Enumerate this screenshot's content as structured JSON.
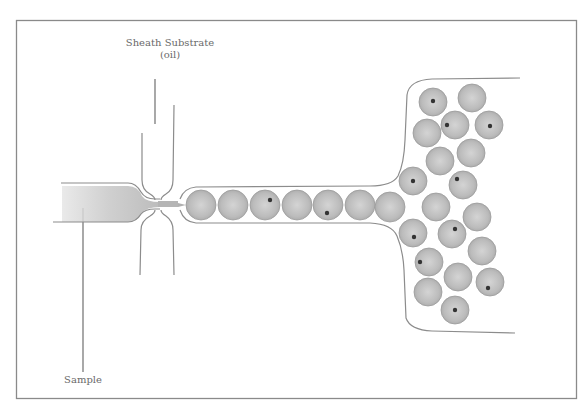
{
  "figure": {
    "labels": {
      "sheath_line1": "Sheath Substrate",
      "sheath_line2": "(oil)",
      "sample": "Sample"
    }
  },
  "colors": {
    "frame": "#8a8a8a",
    "channel_wall": "#8c8c8c",
    "droplet_fill": "#bdbdbd",
    "droplet_edge": "#9a9a9a",
    "cell_dot": "#333333",
    "label_text": "#6a6a6a"
  },
  "channel_droplets": [
    {
      "x": 201,
      "y": 205,
      "cell": false
    },
    {
      "x": 233,
      "y": 205,
      "cell": false
    },
    {
      "x": 265,
      "y": 205,
      "cell": true,
      "dx": 5,
      "dy": -5
    },
    {
      "x": 297,
      "y": 205,
      "cell": false
    },
    {
      "x": 328,
      "y": 205,
      "cell": true,
      "dx": -1,
      "dy": 8
    },
    {
      "x": 360,
      "y": 205,
      "cell": false
    },
    {
      "x": 390,
      "y": 207,
      "cell": false
    }
  ],
  "chamber_droplets": [
    {
      "x": 433,
      "y": 102,
      "cell": true,
      "dx": 0,
      "dy": -1
    },
    {
      "x": 472,
      "y": 98,
      "cell": false
    },
    {
      "x": 427,
      "y": 133,
      "cell": false
    },
    {
      "x": 455,
      "y": 125,
      "cell": true,
      "dx": -8,
      "dy": 0
    },
    {
      "x": 489,
      "y": 125,
      "cell": true,
      "dx": 1,
      "dy": 1
    },
    {
      "x": 440,
      "y": 161,
      "cell": false
    },
    {
      "x": 471,
      "y": 153,
      "cell": false
    },
    {
      "x": 413,
      "y": 181,
      "cell": true,
      "dx": 0,
      "dy": 0
    },
    {
      "x": 463,
      "y": 185,
      "cell": true,
      "dx": -6,
      "dy": -6
    },
    {
      "x": 436,
      "y": 207,
      "cell": false
    },
    {
      "x": 477,
      "y": 217,
      "cell": false
    },
    {
      "x": 413,
      "y": 233,
      "cell": true,
      "dx": 1,
      "dy": 4
    },
    {
      "x": 452,
      "y": 234,
      "cell": true,
      "dx": 3,
      "dy": -5
    },
    {
      "x": 482,
      "y": 251,
      "cell": false
    },
    {
      "x": 429,
      "y": 262,
      "cell": true,
      "dx": -9,
      "dy": 0
    },
    {
      "x": 458,
      "y": 277,
      "cell": false
    },
    {
      "x": 490,
      "y": 282,
      "cell": true,
      "dx": -2,
      "dy": 6
    },
    {
      "x": 428,
      "y": 292,
      "cell": false
    },
    {
      "x": 455,
      "y": 310,
      "cell": true,
      "dx": 0,
      "dy": 0
    }
  ]
}
